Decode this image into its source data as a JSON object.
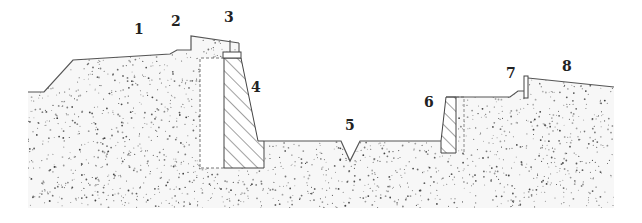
{
  "diagram": {
    "type": "road cross-section (cut with retaining walls)",
    "colors": {
      "background": "#ffffff",
      "outline": "#555555",
      "soil_dots": "#333333",
      "label_text": "#222222"
    },
    "labels": [
      {
        "id": "1",
        "text": "1",
        "x": 134,
        "y": 22
      },
      {
        "id": "2",
        "text": "2",
        "x": 171,
        "y": 14
      },
      {
        "id": "3",
        "text": "3",
        "x": 224,
        "y": 10
      },
      {
        "id": "4",
        "text": "4",
        "x": 251,
        "y": 80
      },
      {
        "id": "5",
        "text": "5",
        "x": 345,
        "y": 118
      },
      {
        "id": "6",
        "text": "6",
        "x": 424,
        "y": 95
      },
      {
        "id": "7",
        "text": "7",
        "x": 506,
        "y": 66
      },
      {
        "id": "8",
        "text": "8",
        "x": 562,
        "y": 59
      }
    ]
  }
}
